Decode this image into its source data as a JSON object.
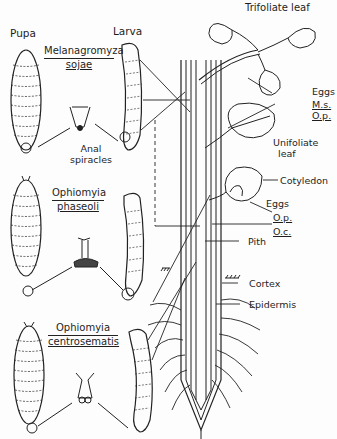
{
  "headers": {
    "pupa": "Pupa",
    "larva": "Larva"
  },
  "species": [
    {
      "genus": "Melanagromyza",
      "epithet": "sojae"
    },
    {
      "genus": "Ophiomyia",
      "epithet": "phaseoli"
    },
    {
      "genus": "Ophiomyia",
      "epithet": "centrosematis"
    }
  ],
  "inset_label": {
    "line1": "Anal",
    "line2": "spiracles"
  },
  "plant_labels": {
    "trifoliate": "Trifoliate leaf",
    "eggs_top": "Eggs",
    "ms": "M.s.",
    "op_top": "O.p.",
    "unifoliate_1": "Unifoliate",
    "unifoliate_2": "leaf",
    "cotyledon": "Cotyledon",
    "eggs_mid": "Eggs",
    "op_mid": "O.p.",
    "oc": "O.c.",
    "pith": "Pith",
    "cortex": "Cortex",
    "epidermis": "Epidermis"
  }
}
